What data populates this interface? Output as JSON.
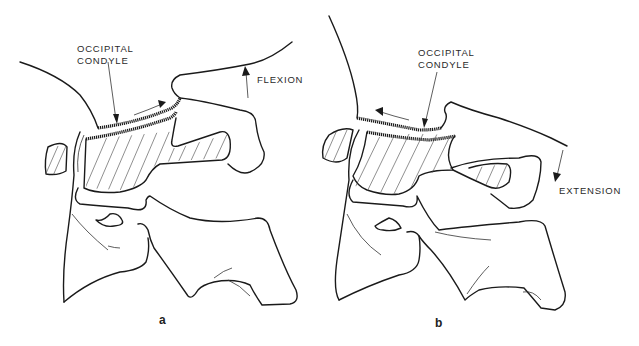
{
  "figure": {
    "panels": [
      {
        "id": "a",
        "letter": "a",
        "structure_label_line1": "OCCIPITAL",
        "structure_label_line2": "CONDYLE",
        "motion_label": "FLEXION",
        "motion_direction": "up"
      },
      {
        "id": "b",
        "letter": "b",
        "structure_label_line1": "OCCIPITAL",
        "structure_label_line2": "CONDYLE",
        "motion_label": "EXTENSION",
        "motion_direction": "down"
      }
    ],
    "colors": {
      "line": "#1a1a1a",
      "background": "#ffffff"
    }
  }
}
